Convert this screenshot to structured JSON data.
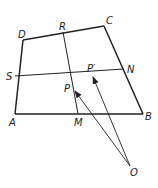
{
  "diagram": {
    "type": "geometry-quadrilateral",
    "stroke_color": "#222222",
    "background": "#ffffff",
    "points": {
      "A": {
        "x": 15,
        "y": 114,
        "label": "A",
        "lx": 9,
        "ly": 126
      },
      "B": {
        "x": 143,
        "y": 114,
        "label": "B",
        "lx": 145,
        "ly": 120
      },
      "C": {
        "x": 104,
        "y": 26,
        "label": "C",
        "lx": 106,
        "ly": 24
      },
      "D": {
        "x": 23,
        "y": 40,
        "label": "D",
        "lx": 18,
        "ly": 38
      },
      "R": {
        "x": 63,
        "y": 32,
        "label": "R",
        "lx": 59,
        "ly": 30
      },
      "S": {
        "x": 15,
        "y": 76,
        "label": "S",
        "lx": 6,
        "ly": 80
      },
      "N": {
        "x": 124,
        "y": 69,
        "label": "N",
        "lx": 127,
        "ly": 73
      },
      "M": {
        "x": 78,
        "y": 114,
        "label": "M",
        "lx": 74,
        "ly": 126
      },
      "P": {
        "x": 75,
        "y": 91,
        "label": "P",
        "lx": 64,
        "ly": 92
      },
      "P_prime": {
        "x": 93,
        "y": 77,
        "label": "P′",
        "lx": 87,
        "ly": 72
      },
      "O": {
        "x": 130,
        "y": 166,
        "label": "O",
        "lx": 130,
        "ly": 176
      }
    },
    "segments": [
      [
        "A",
        "B"
      ],
      [
        "B",
        "C"
      ],
      [
        "C",
        "D"
      ],
      [
        "D",
        "A"
      ],
      [
        "R",
        "M"
      ],
      [
        "S",
        "N"
      ]
    ],
    "arrows": [
      {
        "from": "O",
        "to": "P"
      },
      {
        "from": "O",
        "to": "P_prime"
      }
    ]
  }
}
